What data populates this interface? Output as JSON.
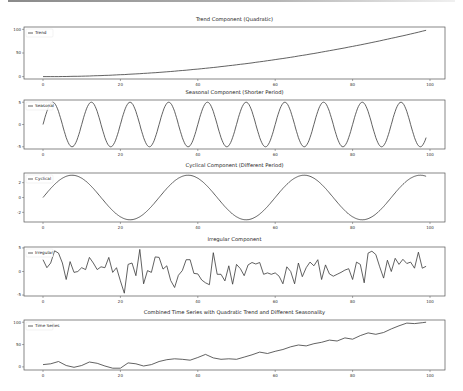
{
  "figure": {
    "width": 463,
    "height": 391,
    "line_color": "#3a3a3a",
    "frame_color": "#555555"
  },
  "chart_data": [
    {
      "type": "line",
      "title": "Trend Component (Quadratic)",
      "legend": "Trend",
      "xlabel": "",
      "ylabel": "",
      "xlim": [
        -5,
        104
      ],
      "ylim": [
        -5,
        105
      ],
      "xticks": [
        "0",
        "20",
        "40",
        "60",
        "80",
        "100"
      ],
      "yticks": [
        "100",
        "50",
        "0"
      ],
      "ytick_values": [
        100,
        50,
        0
      ],
      "formula": "0.01*t^2",
      "x": [
        0,
        10,
        20,
        30,
        40,
        50,
        60,
        70,
        80,
        90,
        99
      ],
      "values": [
        0,
        1,
        4,
        9,
        16,
        25,
        36,
        49,
        64,
        81,
        98
      ]
    },
    {
      "type": "line",
      "title": "Seasonal Component (Shorter Period)",
      "legend": "Seasonal",
      "xlim": [
        -5,
        104
      ],
      "ylim": [
        -5.5,
        5.5
      ],
      "xticks": [
        "0",
        "20",
        "40",
        "60",
        "80",
        "100"
      ],
      "yticks": [
        "5",
        "0",
        "-5"
      ],
      "ytick_values": [
        5,
        0,
        -5
      ],
      "formula": "5*sin(2*pi*t/10)",
      "period": 10,
      "amplitude": 5
    },
    {
      "type": "line",
      "title": "Cyclical Component (Different Period)",
      "legend": "Cyclical",
      "xlim": [
        -5,
        104
      ],
      "ylim": [
        -3.3,
        3.3
      ],
      "xticks": [
        "0",
        "20",
        "40",
        "60",
        "80",
        "100"
      ],
      "yticks": [
        "2",
        "0",
        "-2"
      ],
      "ytick_values": [
        2,
        0,
        -2
      ],
      "formula": "3*sin(2*pi*t/30)",
      "period": 30,
      "amplitude": 3
    },
    {
      "type": "line",
      "title": "Irregular Component",
      "legend": "Irregular",
      "xlim": [
        -5,
        104
      ],
      "ylim": [
        -5.2,
        5.2
      ],
      "xticks": [
        "0",
        "20",
        "40",
        "60",
        "80",
        "100"
      ],
      "yticks": [
        "5",
        "0",
        "-5"
      ],
      "ytick_values": [
        5,
        0,
        -5
      ],
      "x": [
        0,
        1,
        2,
        3,
        4,
        5,
        6,
        7,
        8,
        9,
        10,
        11,
        12,
        13,
        14,
        15,
        16,
        17,
        18,
        19,
        20,
        21,
        22,
        23,
        24,
        25,
        26,
        27,
        28,
        29,
        30,
        31,
        32,
        33,
        34,
        35,
        36,
        37,
        38,
        39,
        40,
        41,
        42,
        43,
        44,
        45,
        46,
        47,
        48,
        49,
        50,
        51,
        52,
        53,
        54,
        55,
        56,
        57,
        58,
        59,
        60,
        61,
        62,
        63,
        64,
        65,
        66,
        67,
        68,
        69,
        70,
        71,
        72,
        73,
        74,
        75,
        76,
        77,
        78,
        79,
        80,
        81,
        82,
        83,
        84,
        85,
        86,
        87,
        88,
        89,
        90,
        91,
        92,
        93,
        94,
        95,
        96,
        97,
        98,
        99
      ],
      "values": [
        2.5,
        0.8,
        1.8,
        4.4,
        3.9,
        1.8,
        -1.7,
        2.1,
        -0.2,
        0.0,
        0.8,
        0.4,
        3.0,
        1.8,
        0.4,
        1.0,
        0.8,
        3.0,
        -0.2,
        0.8,
        -2.0,
        -4.6,
        1.5,
        1.8,
        -0.9,
        4.7,
        -2.6,
        0.2,
        -0.2,
        3.1,
        3.0,
        0.5,
        1.2,
        -1.9,
        -3.4,
        -0.8,
        0.2,
        2.5,
        2.5,
        -0.4,
        -0.5,
        -1.8,
        -2.4,
        -2.8,
        4.0,
        -0.6,
        -0.6,
        -2.0,
        1.2,
        -2.7,
        1.5,
        0.6,
        -0.9,
        1.4,
        1.9,
        1.6,
        1.9,
        -0.6,
        -0.3,
        -0.6,
        -0.3,
        -1.0,
        -2.6,
        1.0,
        0.0,
        -2.6,
        1.8,
        -1.1,
        0.8,
        2.0,
        1.2,
        2.5,
        -1.7,
        1.4,
        -0.5,
        -1.0,
        -0.6,
        -0.2,
        0.3,
        0.6,
        -1.7,
        2.0,
        1.5,
        -2.4,
        3.9,
        4.3,
        3.6,
        1.0,
        -1.4,
        2.4,
        0.0,
        2.8,
        1.5,
        2.6,
        1.7,
        2.0,
        0.7,
        4.1,
        0.7,
        1.1
      ]
    },
    {
      "type": "line",
      "title": "Combined Time Series with Quadratic Trend and Different Seasonality",
      "legend": "Time Series",
      "xlim": [
        -5,
        104
      ],
      "ylim": [
        -7,
        105
      ],
      "xticks": [
        "0",
        "20",
        "40",
        "60",
        "80",
        "100"
      ],
      "yticks": [
        "100",
        "50",
        "0"
      ],
      "ytick_values": [
        100,
        50,
        0
      ],
      "x": [
        0,
        2,
        4,
        6,
        8,
        10,
        12,
        14,
        16,
        18,
        20,
        22,
        24,
        26,
        28,
        30,
        32,
        34,
        36,
        38,
        40,
        42,
        44,
        46,
        48,
        50,
        52,
        54,
        56,
        58,
        60,
        62,
        64,
        66,
        68,
        70,
        72,
        74,
        76,
        78,
        80,
        82,
        84,
        86,
        88,
        90,
        92,
        94,
        96,
        98,
        99
      ],
      "values": [
        5,
        7,
        12,
        3,
        -1,
        3,
        11,
        8,
        2,
        -3,
        -3,
        9,
        7,
        2,
        5,
        12,
        16,
        18,
        17,
        15,
        21,
        28,
        20,
        17,
        18,
        17,
        22,
        27,
        33,
        30,
        35,
        39,
        45,
        49,
        47,
        52,
        55,
        60,
        58,
        65,
        62,
        70,
        76,
        73,
        77,
        85,
        92,
        98,
        97,
        99,
        100
      ]
    }
  ]
}
